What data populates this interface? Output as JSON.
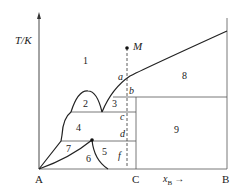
{
  "axes": {
    "y_label": "T/K",
    "x_label": "x",
    "x_label_sub": "B",
    "x_arrow": "→",
    "left_end": "A",
    "right_end": "B",
    "compound": "C"
  },
  "point_M": "M",
  "points": {
    "a": "a",
    "b": "b",
    "c": "c",
    "d": "d",
    "f": "f"
  },
  "regions": [
    "1",
    "2",
    "3",
    "4",
    "5",
    "6",
    "7",
    "8",
    "9"
  ],
  "colors": {
    "line": "#222222",
    "thin": "#555555"
  }
}
